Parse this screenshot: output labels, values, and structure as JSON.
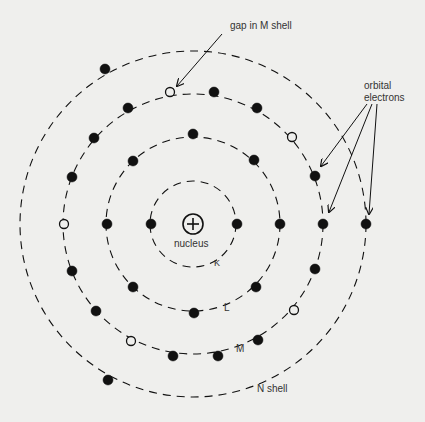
{
  "diagram": {
    "center": [
      193,
      224
    ],
    "colors": {
      "ink": "#111111",
      "background": "#efefed",
      "label": "#333333"
    },
    "nucleus": {
      "label": "nucleus",
      "symbol": "+"
    },
    "shells": [
      {
        "name": "K",
        "label": "K",
        "radius": 43
      },
      {
        "name": "L",
        "label": "L",
        "radius": 87
      },
      {
        "name": "M",
        "label": "M",
        "radius": 130
      },
      {
        "name": "N",
        "label": "N shell",
        "radius": 173
      }
    ],
    "annotations": {
      "gap": "gap in M shell",
      "orbital_line1": "orbital",
      "orbital_line2": "electrons"
    },
    "electrons": [
      {
        "shell": "K",
        "x": 151,
        "y": 224,
        "filled": true
      },
      {
        "shell": "K",
        "x": 237,
        "y": 224,
        "filled": true
      },
      {
        "shell": "L",
        "x": 107,
        "y": 224,
        "filled": true
      },
      {
        "shell": "L",
        "x": 280,
        "y": 224,
        "filled": true
      },
      {
        "shell": "L",
        "x": 193,
        "y": 134,
        "filled": true
      },
      {
        "shell": "L",
        "x": 133,
        "y": 161,
        "filled": true
      },
      {
        "shell": "L",
        "x": 254,
        "y": 160,
        "filled": true
      },
      {
        "shell": "L",
        "x": 133,
        "y": 287,
        "filled": true
      },
      {
        "shell": "L",
        "x": 194,
        "y": 313,
        "filled": true
      },
      {
        "shell": "L",
        "x": 256,
        "y": 287,
        "filled": true
      },
      {
        "shell": "M",
        "x": 64,
        "y": 224,
        "filled": false
      },
      {
        "shell": "M",
        "x": 323,
        "y": 224,
        "filled": true
      },
      {
        "shell": "M",
        "x": 170,
        "y": 92,
        "filled": false
      },
      {
        "shell": "M",
        "x": 214,
        "y": 92,
        "filled": true
      },
      {
        "shell": "M",
        "x": 128,
        "y": 108,
        "filled": true
      },
      {
        "shell": "M",
        "x": 257,
        "y": 108,
        "filled": true
      },
      {
        "shell": "M",
        "x": 94,
        "y": 138,
        "filled": true
      },
      {
        "shell": "M",
        "x": 292,
        "y": 137,
        "filled": false
      },
      {
        "shell": "M",
        "x": 72,
        "y": 177,
        "filled": true
      },
      {
        "shell": "M",
        "x": 315,
        "y": 176,
        "filled": true
      },
      {
        "shell": "M",
        "x": 72,
        "y": 271,
        "filled": true
      },
      {
        "shell": "M",
        "x": 315,
        "y": 269,
        "filled": true
      },
      {
        "shell": "M",
        "x": 96,
        "y": 311,
        "filled": true
      },
      {
        "shell": "M",
        "x": 294,
        "y": 310,
        "filled": false
      },
      {
        "shell": "M",
        "x": 131,
        "y": 341,
        "filled": false
      },
      {
        "shell": "M",
        "x": 258,
        "y": 340,
        "filled": true
      },
      {
        "shell": "M",
        "x": 173,
        "y": 356,
        "filled": true
      },
      {
        "shell": "M",
        "x": 218,
        "y": 356,
        "filled": true
      },
      {
        "shell": "N",
        "x": 366,
        "y": 224,
        "filled": true
      },
      {
        "shell": "N",
        "x": 105,
        "y": 69,
        "filled": true
      },
      {
        "shell": "N",
        "x": 108,
        "y": 380,
        "filled": true
      }
    ]
  }
}
